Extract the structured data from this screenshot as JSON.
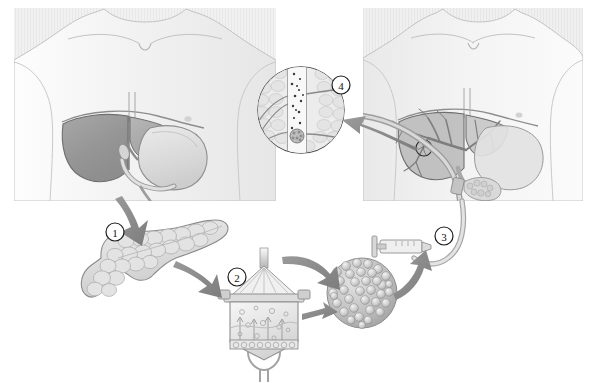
{
  "figure": {
    "background_color": "#ffffff",
    "width": 589,
    "height": 383,
    "ink_color": "#4a4a4a",
    "arrow_color": "#8a8a8a",
    "panel_fill": "#efefef",
    "organ_dark": "#9a9a9a",
    "organ_light": "#d8d8d8"
  },
  "callouts": [
    {
      "id": "callout-1",
      "number": "1",
      "label": "pancreas-procurement",
      "cx": 115,
      "cy": 232,
      "r": 9
    },
    {
      "id": "callout-2",
      "number": "2",
      "label": "islet-isolation-chamber",
      "cx": 237,
      "cy": 277,
      "r": 9
    },
    {
      "id": "callout-3",
      "number": "3",
      "label": "islet-infusion-syringe",
      "cx": 444,
      "cy": 236,
      "r": 9
    },
    {
      "id": "callout-4",
      "number": "4",
      "label": "portal-vein-engraftment",
      "cx": 341,
      "cy": 85,
      "r": 9
    }
  ],
  "panels": [
    {
      "name": "donor-torso-panel",
      "x": 14,
      "y": 8,
      "width": 262,
      "height": 193,
      "organs": [
        "liver",
        "stomach",
        "duodenum",
        "pancreas-duct",
        "gallbladder"
      ]
    },
    {
      "name": "recipient-torso-panel",
      "x": 363,
      "y": 8,
      "width": 220,
      "height": 193,
      "organs": [
        "liver",
        "portal-vein-tree",
        "stomach",
        "duodenum",
        "pancreas",
        "catheter"
      ]
    }
  ],
  "objects": [
    {
      "name": "excised-pancreas",
      "cx": 152,
      "cy": 262
    },
    {
      "name": "ricordi-isolation-chamber",
      "cx": 264,
      "cy": 315
    },
    {
      "name": "purified-islet-cluster",
      "cx": 362,
      "cy": 293
    },
    {
      "name": "infusion-syringe",
      "cx": 404,
      "cy": 249
    },
    {
      "name": "portal-vein-magnifier-inset",
      "cx": 301,
      "cy": 110,
      "r": 44
    },
    {
      "name": "liver-magnified-region-marker",
      "cx": 424,
      "cy": 148,
      "r": 8
    }
  ],
  "arrows": [
    {
      "name": "arrow-torso-to-pancreas",
      "from": "donor-torso-panel",
      "to": "excised-pancreas"
    },
    {
      "name": "arrow-pancreas-to-chamber",
      "from": "excised-pancreas",
      "to": "ricordi-isolation-chamber"
    },
    {
      "name": "arrow-chamber-to-islets",
      "from": "ricordi-isolation-chamber",
      "to": "purified-islet-cluster"
    },
    {
      "name": "arrow-islets-to-syringe",
      "from": "purified-islet-cluster",
      "to": "infusion-syringe"
    },
    {
      "name": "arrow-liver-to-inset",
      "from": "liver-magnified-region-marker",
      "to": "portal-vein-magnifier-inset"
    }
  ]
}
